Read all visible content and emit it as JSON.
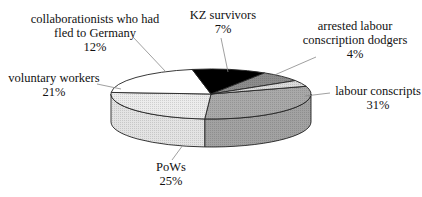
{
  "chart_data": {
    "type": "pie",
    "style": "3d",
    "title": "",
    "categories": [
      "labour conscripts",
      "PoWs",
      "voluntary workers",
      "collaborationists who had fled to Germany",
      "KZ survivors",
      "arrested labour conscription dodgers"
    ],
    "values": [
      31,
      25,
      21,
      12,
      7,
      4
    ],
    "unit": "%",
    "slices": [
      {
        "label": "labour conscripts",
        "value": 31,
        "pct_text": "31%",
        "color": "#a9a9a9"
      },
      {
        "label": "PoWs",
        "value": 25,
        "pct_text": "25%",
        "color": "#ececec"
      },
      {
        "label": "voluntary workers",
        "value": 21,
        "pct_text": "21%",
        "color": "#ffffff"
      },
      {
        "label": "collaborationists who had fled to Germany",
        "value": 12,
        "pct_text": "12%",
        "color": "#000000"
      },
      {
        "label": "KZ survivors",
        "value": 7,
        "pct_text": "7%",
        "color": "#8c8c8c"
      },
      {
        "label": "arrested labour conscription dodgers",
        "value": 4,
        "pct_text": "4%",
        "color": "#dcdcdc"
      }
    ],
    "legend": "none (direct labels with leader lines)"
  },
  "labels": {
    "collab_line1": "collaborationists who had",
    "collab_line2": "fled to Germany",
    "collab_pct": "12%",
    "kz_line1": "KZ survivors",
    "kz_pct": "7%",
    "arrested_line1": "arrested labour",
    "arrested_line2": "conscription dodgers",
    "arrested_pct": "4%",
    "voluntary_line1": "voluntary workers",
    "voluntary_pct": "21%",
    "labour_line1": "labour conscripts",
    "labour_pct": "31%",
    "pows_line1": "PoWs",
    "pows_pct": "25%"
  }
}
